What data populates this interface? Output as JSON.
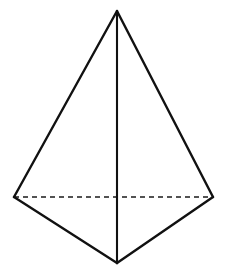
{
  "figure": {
    "kind": "geometry-diagram",
    "shape_name": "tetrahedron",
    "canvas": {
      "width": 227,
      "height": 272,
      "background": "#ffffff"
    },
    "stroke_colors": {
      "solid_edge": "#111111",
      "hidden_edge": "#1a1a1a",
      "background": "#ffffff"
    },
    "stroke_widths": {
      "solid_edge": 2.4,
      "vertical_axis_edge": 2.1,
      "hidden_edge": 1.6
    },
    "dash_pattern": "5,4",
    "vertices": [
      {
        "id": "apex",
        "label": "apex",
        "x": 117,
        "y": 11
      },
      {
        "id": "left",
        "label": "left-corner",
        "x": 14,
        "y": 197
      },
      {
        "id": "right",
        "label": "right-corner",
        "x": 213,
        "y": 197
      },
      {
        "id": "front",
        "label": "front-corner",
        "x": 117,
        "y": 263
      }
    ],
    "edges": [
      {
        "id": "apex-left",
        "from": "apex",
        "to": "left",
        "style": "solid",
        "visible": true
      },
      {
        "id": "apex-right",
        "from": "apex",
        "to": "right",
        "style": "solid",
        "visible": true
      },
      {
        "id": "apex-front",
        "from": "apex",
        "to": "front",
        "style": "solid",
        "visible": true
      },
      {
        "id": "left-front",
        "from": "left",
        "to": "front",
        "style": "solid",
        "visible": true
      },
      {
        "id": "right-front",
        "from": "right",
        "to": "front",
        "style": "solid",
        "visible": true
      },
      {
        "id": "left-right",
        "from": "left",
        "to": "right",
        "style": "dashed",
        "visible": false
      }
    ],
    "faces": [
      {
        "id": "face-left",
        "vertices": [
          "apex",
          "left",
          "front"
        ]
      },
      {
        "id": "face-right",
        "vertices": [
          "apex",
          "right",
          "front"
        ]
      }
    ]
  }
}
